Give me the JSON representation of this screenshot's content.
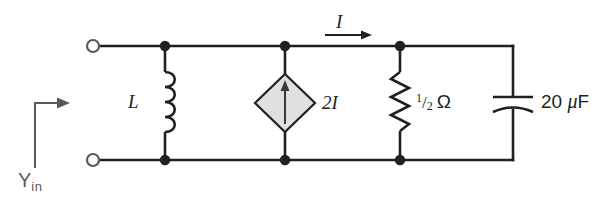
{
  "figure": {
    "kind": "circuit-schematic",
    "background_color": "#ffffff",
    "wire_color": "#231f20",
    "source_fill_color": "#e0e0e0",
    "annotation_color": "#5a5a5a"
  },
  "labels": {
    "inductor": "L",
    "current": "I",
    "dependent_source": "2I",
    "resistor_numerator": "1",
    "resistor_slash": "/",
    "resistor_denominator": "2",
    "resistor_unit": "Ω",
    "capacitor_value": "20",
    "capacitor_mu": "μ",
    "capacitor_unit": "F",
    "input_admittance": "Y",
    "input_admittance_sub": "in"
  },
  "components": [
    {
      "name": "inductor",
      "type": "inductor",
      "label": "L",
      "branch_x": 165,
      "orientation": "vertical"
    },
    {
      "name": "dependent-current-source",
      "type": "current-controlled-current-source",
      "label": "2I",
      "branch_x": 285,
      "orientation": "vertical",
      "arrow_direction": "up"
    },
    {
      "name": "resistor",
      "type": "resistor",
      "label": "1/2 Ω",
      "branch_x": 400,
      "orientation": "vertical"
    },
    {
      "name": "capacitor",
      "type": "capacitor",
      "label": "20 μF",
      "branch_x": 513,
      "orientation": "vertical"
    }
  ],
  "terminals": [
    {
      "name": "top-input-terminal",
      "x": 93,
      "y": 46
    },
    {
      "name": "bottom-input-terminal",
      "x": 93,
      "y": 160
    }
  ],
  "nodes": [
    {
      "x": 165,
      "y": 46
    },
    {
      "x": 285,
      "y": 46
    },
    {
      "x": 400,
      "y": 46
    },
    {
      "x": 165,
      "y": 160
    },
    {
      "x": 285,
      "y": 160
    },
    {
      "x": 400,
      "y": 160
    }
  ],
  "rails": {
    "top_y": 46,
    "bottom_y": 160,
    "left_x": 93,
    "right_x": 513
  }
}
